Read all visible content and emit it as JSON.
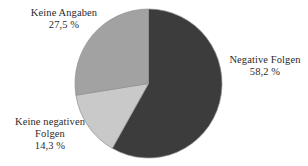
{
  "chart_data": {
    "type": "pie",
    "title": "",
    "subtitle": "",
    "xlabel": "",
    "ylabel": "",
    "grid": false,
    "legend_position": "none",
    "unit": "%",
    "start_angle_deg": 0,
    "direction": "clockwise",
    "categories": [
      "Negative Folgen",
      "Keine negativen Folgen",
      "Keine Angaben"
    ],
    "values": [
      58.2,
      14.3,
      27.5
    ],
    "value_labels": [
      "58,2 %",
      "14,3 %",
      "27,5 %"
    ],
    "colors": [
      "#3c3c3c",
      "#c9c9c9",
      "#a2a2a2"
    ],
    "slices": [
      {
        "name": "Negative Folgen",
        "value": 58.2,
        "value_label": "58,2 %",
        "color": "#3c3c3c",
        "start_deg": 0,
        "end_deg": 209.52,
        "label_lines": [
          "Negative Folgen",
          "58,2 %"
        ]
      },
      {
        "name": "Keine negativen Folgen",
        "value": 14.3,
        "value_label": "14,3 %",
        "color": "#c9c9c9",
        "start_deg": 209.52,
        "end_deg": 261.0,
        "label_lines": [
          "Keine negativen",
          "Folgen",
          "14,3 %"
        ]
      },
      {
        "name": "Keine Angaben",
        "value": 27.5,
        "value_label": "27,5 %",
        "color": "#a2a2a2",
        "start_deg": 261.0,
        "end_deg": 360.0,
        "label_lines": [
          "Keine Angaben",
          "27,5 %"
        ]
      }
    ]
  },
  "labels": {
    "keine_angaben": {
      "name": "Keine Angaben",
      "value": "27,5 %"
    },
    "negative_folgen": {
      "name": "Negative Folgen",
      "value": "58,2 %"
    },
    "keine_negativen_folgen": {
      "name_line1": "Keine negativen",
      "name_line2": "Folgen",
      "value": "14,3 %"
    }
  },
  "style": {
    "background": "#ffffff",
    "text_color": "#2b2b2b",
    "slice_dark": "#3c3c3c",
    "slice_medium": "#a2a2a2",
    "slice_light": "#c9c9c9",
    "outline": "#8f8f8f"
  }
}
